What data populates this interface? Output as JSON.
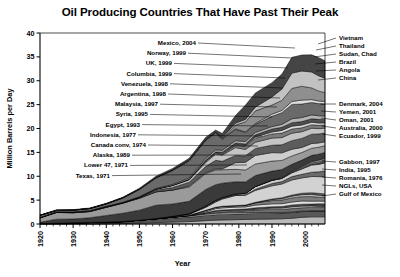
{
  "chart_data": {
    "type": "area",
    "title": "Oil Producing Countries That Have Past Their Peak",
    "xlabel": "Year",
    "ylabel": "Million Barrels per Day",
    "xlim": [
      1920,
      2006
    ],
    "ylim": [
      0,
      40
    ],
    "xticks": [
      "1920",
      "1930",
      "1940",
      "1950",
      "1960",
      "1970",
      "1980",
      "1990",
      "2000"
    ],
    "yticks": [
      "0",
      "5",
      "10",
      "15",
      "20",
      "25",
      "30",
      "35",
      "40"
    ],
    "grid": false,
    "stacked": true,
    "legend_position": "right",
    "x": [
      1920,
      1925,
      1930,
      1935,
      1940,
      1945,
      1950,
      1955,
      1960,
      1965,
      1970,
      1973,
      1975,
      1979,
      1982,
      1985,
      1990,
      1993,
      1996,
      1999,
      2002,
      2004,
      2006
    ],
    "series": [
      {
        "name": "Gulf of Mexico",
        "color": "#b9b9b9",
        "values": [
          0.0,
          0.0,
          0.0,
          0.0,
          0.05,
          0.1,
          0.2,
          0.3,
          0.4,
          0.5,
          0.7,
          0.8,
          0.85,
          0.9,
          0.95,
          1.0,
          1.05,
          1.1,
          1.2,
          1.4,
          1.5,
          1.5,
          1.5
        ]
      },
      {
        "name": "NGLs, USA",
        "color": "#585858",
        "values": [
          0.0,
          0.05,
          0.1,
          0.15,
          0.2,
          0.3,
          0.45,
          0.6,
          0.8,
          0.95,
          1.1,
          1.15,
          1.15,
          1.2,
          1.2,
          1.2,
          1.2,
          1.2,
          1.2,
          1.2,
          1.2,
          1.2,
          1.2
        ]
      },
      {
        "name": "Romania, 1976",
        "color": "#d7d7d7",
        "values": [
          0.1,
          0.12,
          0.14,
          0.16,
          0.15,
          0.12,
          0.14,
          0.17,
          0.2,
          0.23,
          0.26,
          0.28,
          0.3,
          0.27,
          0.24,
          0.21,
          0.16,
          0.13,
          0.12,
          0.11,
          0.1,
          0.1,
          0.1
        ]
      },
      {
        "name": "India, 1995",
        "color": "#6e6e6e",
        "values": [
          0.0,
          0.0,
          0.0,
          0.0,
          0.0,
          0.0,
          0.01,
          0.02,
          0.03,
          0.05,
          0.15,
          0.2,
          0.25,
          0.3,
          0.4,
          0.55,
          0.65,
          0.62,
          0.72,
          0.7,
          0.68,
          0.66,
          0.65
        ]
      },
      {
        "name": "Gabbon, 1997",
        "color": "#c8c8c8",
        "values": [
          0.0,
          0.0,
          0.0,
          0.0,
          0.0,
          0.0,
          0.0,
          0.0,
          0.01,
          0.05,
          0.11,
          0.2,
          0.22,
          0.2,
          0.16,
          0.16,
          0.27,
          0.3,
          0.36,
          0.34,
          0.3,
          0.26,
          0.24
        ]
      },
      {
        "name": "Ecuador, 1999",
        "color": "#474747",
        "values": [
          0.0,
          0.0,
          0.0,
          0.0,
          0.0,
          0.0,
          0.0,
          0.0,
          0.0,
          0.01,
          0.02,
          0.2,
          0.18,
          0.21,
          0.21,
          0.28,
          0.29,
          0.32,
          0.39,
          0.41,
          0.4,
          0.53,
          0.55
        ]
      },
      {
        "name": "Australia, 2000",
        "color": "#e2e2e2",
        "values": [
          0.0,
          0.0,
          0.0,
          0.0,
          0.0,
          0.0,
          0.0,
          0.0,
          0.0,
          0.02,
          0.2,
          0.38,
          0.42,
          0.45,
          0.42,
          0.55,
          0.6,
          0.58,
          0.6,
          0.66,
          0.6,
          0.55,
          0.52
        ]
      },
      {
        "name": "Oman, 2001",
        "color": "#7d7d7d",
        "values": [
          0.0,
          0.0,
          0.0,
          0.0,
          0.0,
          0.0,
          0.0,
          0.0,
          0.0,
          0.0,
          0.33,
          0.3,
          0.34,
          0.3,
          0.34,
          0.5,
          0.69,
          0.78,
          0.88,
          0.91,
          0.96,
          0.82,
          0.78
        ]
      },
      {
        "name": "Yemen, 2001",
        "color": "#bdbdbd",
        "values": [
          0.0,
          0.0,
          0.0,
          0.0,
          0.0,
          0.0,
          0.0,
          0.0,
          0.0,
          0.0,
          0.0,
          0.0,
          0.0,
          0.0,
          0.0,
          0.0,
          0.2,
          0.3,
          0.37,
          0.42,
          0.45,
          0.42,
          0.39
        ]
      },
      {
        "name": "Denmark, 2004",
        "color": "#5f5f5f",
        "values": [
          0.0,
          0.0,
          0.0,
          0.0,
          0.0,
          0.0,
          0.0,
          0.0,
          0.0,
          0.0,
          0.0,
          0.0,
          0.01,
          0.03,
          0.05,
          0.09,
          0.12,
          0.16,
          0.21,
          0.3,
          0.37,
          0.39,
          0.37
        ]
      },
      {
        "name": "China",
        "color": "#d2d2d2",
        "values": [
          0.0,
          0.0,
          0.0,
          0.0,
          0.0,
          0.0,
          0.0,
          0.05,
          0.1,
          0.23,
          0.6,
          1.1,
          1.5,
          2.1,
          2.05,
          2.5,
          2.77,
          2.89,
          3.17,
          3.2,
          3.39,
          3.49,
          3.6
        ]
      },
      {
        "name": "Angola",
        "color": "#6b6b6b",
        "values": [
          0.0,
          0.0,
          0.0,
          0.0,
          0.0,
          0.0,
          0.0,
          0.0,
          0.0,
          0.01,
          0.1,
          0.16,
          0.17,
          0.14,
          0.13,
          0.23,
          0.48,
          0.5,
          0.71,
          0.75,
          0.9,
          1.0,
          1.2
        ]
      },
      {
        "name": "Brazil",
        "color": "#cfcfcf",
        "values": [
          0.0,
          0.0,
          0.0,
          0.0,
          0.0,
          0.0,
          0.0,
          0.0,
          0.07,
          0.1,
          0.17,
          0.17,
          0.17,
          0.2,
          0.27,
          0.56,
          0.65,
          0.66,
          0.81,
          1.13,
          1.5,
          1.55,
          1.7
        ]
      },
      {
        "name": "Sudan, Chad",
        "color": "#4f4f4f",
        "values": [
          0.0,
          0.0,
          0.0,
          0.0,
          0.0,
          0.0,
          0.0,
          0.0,
          0.0,
          0.0,
          0.0,
          0.0,
          0.0,
          0.0,
          0.0,
          0.0,
          0.0,
          0.0,
          0.0,
          0.06,
          0.22,
          0.3,
          0.4
        ]
      },
      {
        "name": "Thailand",
        "color": "#e0e0e0",
        "values": [
          0.0,
          0.0,
          0.0,
          0.0,
          0.0,
          0.0,
          0.0,
          0.0,
          0.0,
          0.0,
          0.0,
          0.0,
          0.0,
          0.0,
          0.0,
          0.02,
          0.04,
          0.06,
          0.09,
          0.12,
          0.17,
          0.2,
          0.23
        ]
      },
      {
        "name": "Vietnam",
        "color": "#8a8a8a",
        "values": [
          0.0,
          0.0,
          0.0,
          0.0,
          0.0,
          0.0,
          0.0,
          0.0,
          0.0,
          0.0,
          0.0,
          0.0,
          0.0,
          0.0,
          0.0,
          0.01,
          0.06,
          0.12,
          0.18,
          0.27,
          0.34,
          0.4,
          0.36
        ]
      },
      {
        "name": "Texas, 1971",
        "color": "#3a3a3a",
        "values": [
          0.28,
          0.85,
          0.82,
          1.0,
          1.4,
          1.75,
          2.1,
          2.8,
          2.6,
          2.6,
          3.5,
          3.3,
          3.0,
          2.55,
          2.4,
          2.3,
          1.85,
          1.7,
          1.5,
          1.4,
          1.3,
          1.25,
          1.2
        ]
      },
      {
        "name": "Lower 47, 1971",
        "color": "#9a9a9a",
        "values": [
          0.9,
          1.4,
          1.3,
          1.3,
          1.7,
          2.1,
          2.5,
          2.8,
          2.9,
          3.0,
          3.3,
          3.1,
          2.8,
          2.6,
          2.5,
          2.4,
          2.1,
          1.9,
          1.75,
          1.6,
          1.5,
          1.45,
          1.4
        ]
      },
      {
        "name": "Alaska, 1989",
        "color": "#cdcdcd",
        "values": [
          0.0,
          0.0,
          0.0,
          0.0,
          0.0,
          0.0,
          0.0,
          0.0,
          0.01,
          0.2,
          0.2,
          0.2,
          0.18,
          1.4,
          1.6,
          1.8,
          1.77,
          1.58,
          1.4,
          1.05,
          0.98,
          0.9,
          0.83
        ]
      },
      {
        "name": "Canada conv, 1974",
        "color": "#5c5c5c",
        "values": [
          0.02,
          0.03,
          0.03,
          0.03,
          0.05,
          0.08,
          0.15,
          0.38,
          0.52,
          0.8,
          1.3,
          1.8,
          1.6,
          1.5,
          1.35,
          1.47,
          1.55,
          1.7,
          1.8,
          1.9,
          1.95,
          1.9,
          1.85
        ]
      },
      {
        "name": "Indonesia, 1977",
        "color": "#c4c4c4",
        "values": [
          0.05,
          0.07,
          0.1,
          0.12,
          0.1,
          0.03,
          0.06,
          0.17,
          0.4,
          0.48,
          0.85,
          1.3,
          1.3,
          1.65,
          1.35,
          1.3,
          1.5,
          1.5,
          1.56,
          1.4,
          1.25,
          1.1,
          1.0
        ]
      },
      {
        "name": "Egypt, 1993",
        "color": "#7a7a7a",
        "values": [
          0.0,
          0.0,
          0.0,
          0.0,
          0.01,
          0.01,
          0.03,
          0.05,
          0.07,
          0.12,
          0.33,
          0.25,
          0.25,
          0.52,
          0.68,
          0.85,
          0.87,
          0.94,
          0.87,
          0.83,
          0.75,
          0.7,
          0.66
        ]
      },
      {
        "name": "Syria, 1995",
        "color": "#dadada",
        "values": [
          0.0,
          0.0,
          0.0,
          0.0,
          0.0,
          0.0,
          0.0,
          0.0,
          0.0,
          0.02,
          0.1,
          0.11,
          0.18,
          0.17,
          0.17,
          0.25,
          0.4,
          0.56,
          0.6,
          0.56,
          0.52,
          0.48,
          0.44
        ]
      },
      {
        "name": "Malaysia, 1997",
        "color": "#505050",
        "values": [
          0.0,
          0.0,
          0.0,
          0.0,
          0.0,
          0.0,
          0.0,
          0.0,
          0.0,
          0.0,
          0.02,
          0.1,
          0.17,
          0.28,
          0.3,
          0.45,
          0.62,
          0.65,
          0.73,
          0.72,
          0.72,
          0.77,
          0.74
        ]
      },
      {
        "name": "Argentina, 1998",
        "color": "#b5b5b5",
        "values": [
          0.02,
          0.03,
          0.03,
          0.03,
          0.04,
          0.05,
          0.07,
          0.1,
          0.19,
          0.28,
          0.4,
          0.42,
          0.4,
          0.48,
          0.5,
          0.5,
          0.52,
          0.62,
          0.82,
          0.86,
          0.8,
          0.75,
          0.72
        ]
      },
      {
        "name": "Venezuela, 1998",
        "color": "#6a6a6a",
        "values": [
          0.46,
          0.3,
          0.37,
          0.43,
          0.5,
          0.89,
          1.5,
          2.16,
          2.85,
          3.5,
          3.7,
          3.4,
          2.35,
          2.35,
          1.9,
          1.7,
          2.14,
          2.45,
          3.0,
          2.83,
          2.6,
          2.55,
          2.5
        ]
      },
      {
        "name": "Columbia, 1999",
        "color": "#dedede",
        "values": [
          0.0,
          0.0,
          0.02,
          0.03,
          0.03,
          0.07,
          0.09,
          0.12,
          0.15,
          0.2,
          0.22,
          0.19,
          0.16,
          0.13,
          0.14,
          0.17,
          0.45,
          0.46,
          0.62,
          0.82,
          0.6,
          0.55,
          0.53
        ]
      },
      {
        "name": "UK, 1999",
        "color": "#8f8f8f",
        "values": [
          0.0,
          0.0,
          0.0,
          0.0,
          0.0,
          0.0,
          0.0,
          0.0,
          0.0,
          0.0,
          0.0,
          0.02,
          0.02,
          0.8,
          2.1,
          2.65,
          1.92,
          2.1,
          2.74,
          2.9,
          2.45,
          2.1,
          1.85
        ]
      },
      {
        "name": "Norway, 1999",
        "color": "#c2c2c2",
        "values": [
          0.0,
          0.0,
          0.0,
          0.0,
          0.0,
          0.0,
          0.0,
          0.0,
          0.0,
          0.0,
          0.0,
          0.03,
          0.19,
          0.4,
          0.5,
          0.8,
          1.7,
          2.38,
          3.2,
          3.2,
          3.33,
          3.2,
          3.0
        ]
      },
      {
        "name": "Mexico, 2004",
        "color": "#454545",
        "values": [
          0.02,
          0.14,
          0.1,
          0.11,
          0.12,
          0.12,
          0.2,
          0.3,
          0.33,
          0.4,
          0.49,
          0.52,
          0.8,
          1.6,
          3.0,
          2.95,
          2.98,
          3.13,
          3.3,
          3.35,
          3.6,
          3.8,
          3.7
        ]
      }
    ],
    "annotations_left": [
      {
        "label": "Mexico, 2004"
      },
      {
        "label": "Norway, 1999"
      },
      {
        "label": "UK, 1999"
      },
      {
        "label": "Columbia, 1999"
      },
      {
        "label": "Venezuela, 1998"
      },
      {
        "label": "Argentina, 1998"
      },
      {
        "label": "Malaysia, 1997"
      },
      {
        "label": "Syria, 1995"
      },
      {
        "label": "Egypt, 1993"
      },
      {
        "label": "Indonesia, 1977"
      },
      {
        "label": "Canada conv, 1974"
      },
      {
        "label": "Alaska, 1989"
      },
      {
        "label": "Lower 47, 1971"
      },
      {
        "label": "Texas, 1971"
      }
    ],
    "legend_right": [
      {
        "label": "Vietnam"
      },
      {
        "label": "Thailand"
      },
      {
        "label": "Sudan, Chad"
      },
      {
        "label": "Brazil"
      },
      {
        "label": "Angola"
      },
      {
        "label": "China"
      },
      {
        "label": "Denmark, 2004"
      },
      {
        "label": "Yemen, 2001"
      },
      {
        "label": "Oman, 2001"
      },
      {
        "label": "Australia, 2000"
      },
      {
        "label": "Ecuador, 1999"
      },
      {
        "label": "Gabbon, 1997"
      },
      {
        "label": "India, 1995"
      },
      {
        "label": "Romania, 1976"
      },
      {
        "label": "NGLs, USA"
      },
      {
        "label": "Gulf of Mexico"
      }
    ]
  }
}
